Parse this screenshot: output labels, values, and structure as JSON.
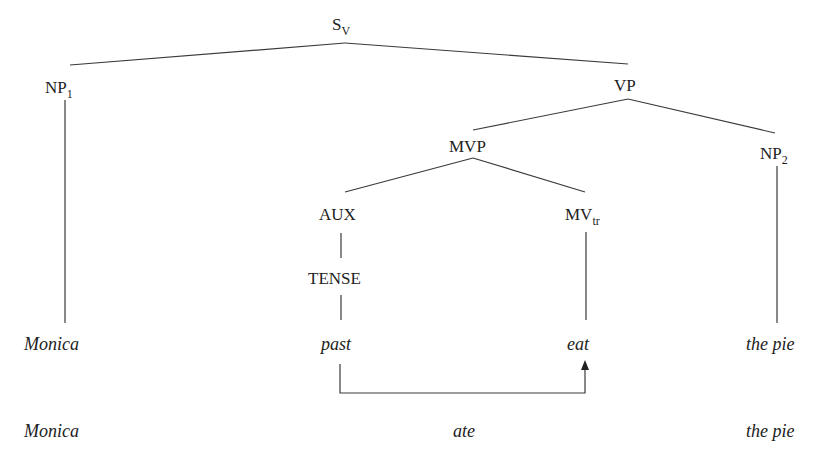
{
  "diagram": {
    "type": "syntax-tree",
    "nodes": {
      "root": {
        "label": "S",
        "sub": "V"
      },
      "np1": {
        "label": "NP",
        "sub": "1"
      },
      "vp": {
        "label": "VP",
        "sub": ""
      },
      "mvp": {
        "label": "MVP",
        "sub": ""
      },
      "np2": {
        "label": "NP",
        "sub": "2"
      },
      "aux": {
        "label": "AUX",
        "sub": ""
      },
      "mv": {
        "label": "MV",
        "sub": "tr"
      },
      "tense": {
        "label": "TENSE",
        "sub": ""
      }
    },
    "deep_structure": [
      "Monica",
      "past",
      "eat",
      "the pie"
    ],
    "surface_structure": [
      "Monica",
      "ate",
      "the pie"
    ],
    "edges": [
      [
        "root",
        "np1"
      ],
      [
        "root",
        "vp"
      ],
      [
        "vp",
        "mvp"
      ],
      [
        "vp",
        "np2"
      ],
      [
        "mvp",
        "aux"
      ],
      [
        "mvp",
        "mv"
      ],
      [
        "aux",
        "tense"
      ],
      [
        "tense",
        "past"
      ],
      [
        "np1",
        "Monica"
      ],
      [
        "mv",
        "eat"
      ],
      [
        "np2",
        "the pie"
      ]
    ],
    "transformation_arrow": {
      "from": "past",
      "to": "eat"
    }
  }
}
